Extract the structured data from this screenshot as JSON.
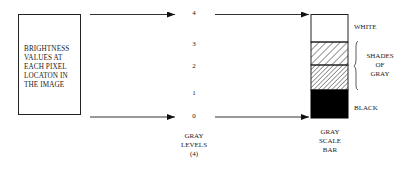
{
  "source_box": {
    "lines": [
      "BRIGHTNESS",
      "VALUES AT",
      "EACH PIXEL",
      "LOCATON IN",
      "THE IMAGE"
    ]
  },
  "gray_levels": {
    "values": [
      "4",
      "3",
      "2",
      "1",
      "0"
    ],
    "caption": [
      "GRAY",
      "LEVELS",
      "(4)"
    ]
  },
  "gray_scale_bar": {
    "caption": [
      "GRAY",
      "SCALE",
      "BAR"
    ],
    "segments": [
      {
        "name": "white",
        "fill": "#ffffff"
      },
      {
        "name": "light-hatch",
        "fill": "hatch"
      },
      {
        "name": "dense-hatch",
        "fill": "hatch-dense"
      },
      {
        "name": "black",
        "fill": "#000000"
      }
    ]
  },
  "labels": {
    "white": "WHITE",
    "shades": [
      "SHADES",
      "OF",
      "GRAY"
    ],
    "black": "BLACK"
  }
}
